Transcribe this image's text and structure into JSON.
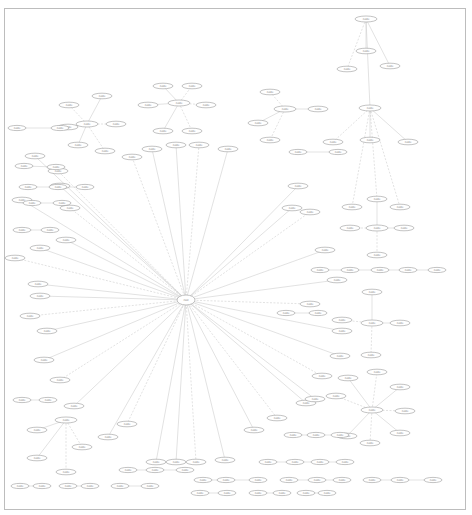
{
  "diagram": {
    "type": "graph",
    "layout": "radial-hub-with-satellite-clusters",
    "hub": {
      "id": "hub",
      "label": "root",
      "x": 186,
      "y": 300,
      "rx": 9,
      "ry": 5
    },
    "nodes": [
      {
        "id": "n1",
        "label": "node",
        "x": 132,
        "y": 157
      },
      {
        "id": "n2",
        "label": "node",
        "x": 152,
        "y": 149
      },
      {
        "id": "n3",
        "label": "node",
        "x": 176,
        "y": 145
      },
      {
        "id": "n4",
        "label": "node",
        "x": 199,
        "y": 145
      },
      {
        "id": "n5",
        "label": "node",
        "x": 228,
        "y": 149
      },
      {
        "id": "n6",
        "label": "node",
        "x": 35,
        "y": 156
      },
      {
        "id": "n7",
        "label": "node",
        "x": 58,
        "y": 171
      },
      {
        "id": "n8",
        "label": "node",
        "x": 60,
        "y": 186
      },
      {
        "id": "n9",
        "label": "node",
        "x": 22,
        "y": 200
      },
      {
        "id": "n10",
        "label": "node",
        "x": 70,
        "y": 208
      },
      {
        "id": "n11",
        "label": "node",
        "x": 66,
        "y": 240
      },
      {
        "id": "n12",
        "label": "node",
        "x": 40,
        "y": 248
      },
      {
        "id": "n13",
        "label": "node",
        "x": 15,
        "y": 258
      },
      {
        "id": "n14",
        "label": "node",
        "x": 38,
        "y": 284
      },
      {
        "id": "n15",
        "label": "node",
        "x": 40,
        "y": 296
      },
      {
        "id": "n16",
        "label": "node",
        "x": 30,
        "y": 316
      },
      {
        "id": "n17",
        "label": "node",
        "x": 47,
        "y": 331
      },
      {
        "id": "n18",
        "label": "node",
        "x": 44,
        "y": 360
      },
      {
        "id": "n19",
        "label": "node",
        "x": 60,
        "y": 380
      },
      {
        "id": "n20",
        "label": "node",
        "x": 74,
        "y": 406
      },
      {
        "id": "n21",
        "label": "node",
        "x": 108,
        "y": 437
      },
      {
        "id": "n22",
        "label": "node",
        "x": 127,
        "y": 424
      },
      {
        "id": "n23",
        "label": "node",
        "x": 156,
        "y": 462
      },
      {
        "id": "n24",
        "label": "node",
        "x": 176,
        "y": 462
      },
      {
        "id": "n25",
        "label": "node",
        "x": 196,
        "y": 462
      },
      {
        "id": "n26",
        "label": "node",
        "x": 225,
        "y": 460
      },
      {
        "id": "n27",
        "label": "node",
        "x": 254,
        "y": 430
      },
      {
        "id": "n28",
        "label": "node",
        "x": 277,
        "y": 418
      },
      {
        "id": "n29",
        "label": "node",
        "x": 306,
        "y": 403
      },
      {
        "id": "n30",
        "label": "node",
        "x": 315,
        "y": 399
      },
      {
        "id": "n31",
        "label": "node",
        "x": 322,
        "y": 376
      },
      {
        "id": "n32",
        "label": "node",
        "x": 340,
        "y": 356
      },
      {
        "id": "n33",
        "label": "node",
        "x": 342,
        "y": 331
      },
      {
        "id": "n34",
        "label": "node",
        "x": 310,
        "y": 304
      },
      {
        "id": "n35",
        "label": "node",
        "x": 337,
        "y": 280
      },
      {
        "id": "n36",
        "label": "node",
        "x": 325,
        "y": 250
      },
      {
        "id": "n37",
        "label": "node",
        "x": 310,
        "y": 212
      },
      {
        "id": "n38",
        "label": "node",
        "x": 292,
        "y": 208
      },
      {
        "id": "n39",
        "label": "node",
        "x": 298,
        "y": 186
      }
    ],
    "clusters": [
      {
        "center": {
          "id": "c1",
          "label": "node",
          "x": 179,
          "y": 103
        },
        "children": [
          {
            "x": 163,
            "y": 86
          },
          {
            "x": 192,
            "y": 86
          },
          {
            "x": 148,
            "y": 105
          },
          {
            "x": 206,
            "y": 105
          },
          {
            "x": 163,
            "y": 131
          },
          {
            "x": 192,
            "y": 131
          }
        ]
      },
      {
        "center": {
          "id": "c2",
          "label": "node",
          "x": 87,
          "y": 124
        },
        "children": [
          {
            "x": 68,
            "y": 127
          },
          {
            "x": 116,
            "y": 124
          },
          {
            "x": 78,
            "y": 145
          },
          {
            "x": 105,
            "y": 151
          },
          {
            "x": 102,
            "y": 96
          },
          {
            "x": 69,
            "y": 105
          }
        ]
      },
      {
        "center": {
          "id": "c3",
          "label": "node",
          "x": 366,
          "y": 19
        },
        "children": [
          {
            "x": 366,
            "y": 51
          },
          {
            "x": 347,
            "y": 69
          },
          {
            "x": 390,
            "y": 66
          }
        ]
      },
      {
        "center": {
          "id": "c4",
          "label": "node",
          "x": 370,
          "y": 108
        },
        "children": [
          {
            "x": 370,
            "y": 140
          },
          {
            "x": 333,
            "y": 142
          },
          {
            "x": 408,
            "y": 142
          }
        ]
      },
      {
        "center": {
          "id": "c5",
          "label": "node",
          "x": 285,
          "y": 109
        },
        "children": [
          {
            "x": 318,
            "y": 109
          },
          {
            "x": 270,
            "y": 140
          },
          {
            "x": 258,
            "y": 123
          },
          {
            "x": 270,
            "y": 92
          }
        ]
      },
      {
        "center": {
          "id": "c6",
          "label": "node",
          "x": 377,
          "y": 228
        },
        "children": [
          {
            "x": 377,
            "y": 199
          },
          {
            "x": 350,
            "y": 228
          },
          {
            "x": 404,
            "y": 228
          },
          {
            "x": 377,
            "y": 255
          }
        ]
      },
      {
        "center": {
          "id": "c7",
          "label": "node",
          "x": 372,
          "y": 323
        },
        "children": [
          {
            "x": 372,
            "y": 292
          },
          {
            "x": 342,
            "y": 320
          },
          {
            "x": 400,
            "y": 323
          },
          {
            "x": 371,
            "y": 355
          }
        ]
      },
      {
        "center": {
          "id": "c8",
          "label": "node",
          "x": 372,
          "y": 410
        },
        "children": [
          {
            "x": 348,
            "y": 378
          },
          {
            "x": 377,
            "y": 372
          },
          {
            "x": 400,
            "y": 387
          },
          {
            "x": 405,
            "y": 411
          },
          {
            "x": 400,
            "y": 433
          },
          {
            "x": 370,
            "y": 443
          },
          {
            "x": 347,
            "y": 436
          },
          {
            "x": 336,
            "y": 396
          }
        ]
      },
      {
        "center": {
          "id": "c9",
          "label": "node",
          "x": 66,
          "y": 420
        },
        "children": [
          {
            "x": 37,
            "y": 430
          },
          {
            "x": 82,
            "y": 447
          },
          {
            "x": 37,
            "y": 458
          },
          {
            "x": 66,
            "y": 472
          }
        ]
      }
    ],
    "chains": [
      [
        {
          "x": 17,
          "y": 128
        },
        {
          "x": 60,
          "y": 128
        }
      ],
      [
        {
          "x": 24,
          "y": 166
        },
        {
          "x": 56,
          "y": 167
        }
      ],
      [
        {
          "x": 28,
          "y": 187
        },
        {
          "x": 58,
          "y": 187
        },
        {
          "x": 85,
          "y": 187
        }
      ],
      [
        {
          "x": 32,
          "y": 203
        },
        {
          "x": 62,
          "y": 203
        }
      ],
      [
        {
          "x": 22,
          "y": 230
        },
        {
          "x": 50,
          "y": 230
        }
      ],
      [
        {
          "x": 298,
          "y": 152
        },
        {
          "x": 338,
          "y": 152
        }
      ],
      [
        {
          "x": 320,
          "y": 270
        },
        {
          "x": 350,
          "y": 270
        },
        {
          "x": 380,
          "y": 270
        },
        {
          "x": 408,
          "y": 270
        },
        {
          "x": 437,
          "y": 270
        }
      ],
      [
        {
          "x": 286,
          "y": 313
        },
        {
          "x": 318,
          "y": 313
        }
      ],
      [
        {
          "x": 22,
          "y": 400
        },
        {
          "x": 48,
          "y": 400
        }
      ],
      [
        {
          "x": 128,
          "y": 470
        },
        {
          "x": 155,
          "y": 470
        },
        {
          "x": 185,
          "y": 470
        }
      ],
      [
        {
          "x": 20,
          "y": 486
        },
        {
          "x": 42,
          "y": 486
        }
      ],
      [
        {
          "x": 68,
          "y": 486
        },
        {
          "x": 90,
          "y": 486
        }
      ],
      [
        {
          "x": 120,
          "y": 486
        },
        {
          "x": 150,
          "y": 486
        }
      ],
      [
        {
          "x": 203,
          "y": 480
        },
        {
          "x": 226,
          "y": 480
        },
        {
          "x": 258,
          "y": 480
        }
      ],
      [
        {
          "x": 289,
          "y": 480
        },
        {
          "x": 317,
          "y": 480
        },
        {
          "x": 342,
          "y": 480
        }
      ],
      [
        {
          "x": 372,
          "y": 480
        },
        {
          "x": 400,
          "y": 480
        },
        {
          "x": 433,
          "y": 480
        }
      ],
      [
        {
          "x": 200,
          "y": 493
        },
        {
          "x": 227,
          "y": 493
        }
      ],
      [
        {
          "x": 258,
          "y": 493
        },
        {
          "x": 282,
          "y": 493
        }
      ],
      [
        {
          "x": 306,
          "y": 493
        },
        {
          "x": 327,
          "y": 493
        }
      ],
      [
        {
          "x": 268,
          "y": 462
        },
        {
          "x": 295,
          "y": 462
        },
        {
          "x": 320,
          "y": 462
        },
        {
          "x": 345,
          "y": 462
        }
      ],
      [
        {
          "x": 293,
          "y": 435
        },
        {
          "x": 316,
          "y": 435
        },
        {
          "x": 340,
          "y": 435
        }
      ]
    ],
    "colors": {
      "border": "#bdbdbd",
      "node_stroke": "#9a9a9a",
      "edge": "#c4c4c4",
      "text": "#777777",
      "background": "#ffffff"
    }
  }
}
